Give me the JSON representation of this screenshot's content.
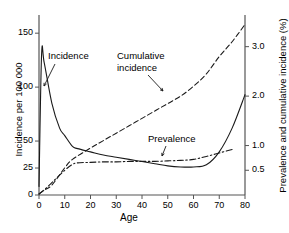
{
  "chart_data": {
    "type": "line",
    "title": "",
    "xlabel": "Age",
    "ylabel_left": "Incidence per 100 000",
    "ylabel_right": "Prevalence and cumulative incidence (%)",
    "xlim": [
      0,
      80
    ],
    "ylim_left": [
      0,
      165
    ],
    "ylim_right": [
      0,
      3.6
    ],
    "grid": false,
    "legend_position": "inline-annotations",
    "xticks": [
      0,
      10,
      20,
      30,
      40,
      50,
      60,
      70,
      80
    ],
    "xtick_labels": [
      "0",
      "10",
      "20",
      "30",
      "40",
      "50",
      "60",
      "70",
      "80"
    ],
    "yticks_left": [
      0,
      25,
      50,
      100,
      150
    ],
    "ytick_labels_left": [
      "0",
      "25",
      "50",
      "100",
      "150"
    ],
    "yticks_right": [
      0.5,
      1.0,
      2.0,
      3.0
    ],
    "ytick_labels_right": [
      "0.5",
      "1.0",
      "2.0",
      "3.0"
    ],
    "series": [
      {
        "name": "Incidence",
        "axis": "left",
        "linestyle": "solid",
        "color": "#1a1a1a",
        "x": [
          0,
          1,
          2,
          5,
          8,
          10,
          13,
          15,
          20,
          25,
          30,
          35,
          40,
          45,
          50,
          55,
          60,
          65,
          70,
          75,
          80
        ],
        "y": [
          8,
          130,
          123,
          85,
          62,
          55,
          45,
          43,
          40,
          37,
          35,
          33,
          31,
          29,
          27,
          26,
          26,
          28,
          40,
          62,
          93
        ]
      },
      {
        "name": "Cumulative incidence",
        "axis": "right",
        "linestyle": "dashed",
        "color": "#1a1a1a",
        "x": [
          0,
          2,
          5,
          10,
          13,
          20,
          25,
          30,
          35,
          40,
          45,
          50,
          55,
          60,
          65,
          70,
          75,
          80
        ],
        "y": [
          0.02,
          0.1,
          0.2,
          0.55,
          0.72,
          0.95,
          1.1,
          1.25,
          1.4,
          1.55,
          1.7,
          1.85,
          2.0,
          2.2,
          2.45,
          2.8,
          3.1,
          3.45
        ]
      },
      {
        "name": "Prevalence",
        "axis": "right",
        "linestyle": "dashdot",
        "color": "#1a1a1a",
        "x": [
          0,
          2,
          5,
          10,
          13,
          15,
          20,
          25,
          30,
          35,
          40,
          45,
          50,
          55,
          60,
          65,
          70,
          75
        ],
        "y": [
          0.02,
          0.1,
          0.25,
          0.5,
          0.62,
          0.65,
          0.66,
          0.67,
          0.67,
          0.68,
          0.68,
          0.68,
          0.69,
          0.7,
          0.72,
          0.78,
          0.85,
          0.92
        ]
      }
    ],
    "annotations": [
      {
        "name": "incidence-label",
        "text": "Incidence",
        "x_px": 48,
        "y_px": 57
      },
      {
        "name": "cumulative-incidence-label-line1",
        "text": "Cumulative",
        "x_px": 117,
        "y_px": 57
      },
      {
        "name": "cumulative-incidence-label-line2",
        "text": "incidence",
        "x_px": 117,
        "y_px": 68
      },
      {
        "name": "prevalence-label",
        "text": "Prevalence",
        "x_px": 148,
        "y_px": 139
      }
    ]
  },
  "axis": {
    "x_title": "Age",
    "y_left_title": "Incidence per 100 000",
    "y_right_title": "Prevalence and cumulative incidence (%)"
  },
  "ticks": {
    "x": [
      "0",
      "10",
      "20",
      "30",
      "40",
      "50",
      "60",
      "70",
      "80"
    ],
    "y_left": [
      "0",
      "25",
      "50",
      "100",
      "150"
    ],
    "y_right": [
      "0.5",
      "1.0",
      "2.0",
      "3.0"
    ]
  },
  "labels": {
    "incidence": "Incidence",
    "cumulative_line1": "Cumulative",
    "cumulative_line2": "incidence",
    "prevalence": "Prevalence"
  },
  "colors": {
    "line": "#1a1a1a",
    "axis": "#555555",
    "background": "#ffffff"
  }
}
